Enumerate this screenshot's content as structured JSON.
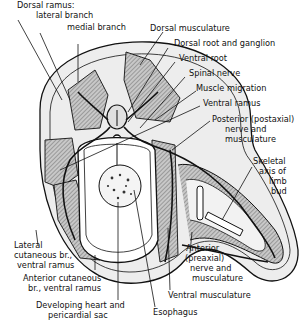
{
  "diagram": {
    "type": "anatomical cross-section",
    "labels": {
      "dorsal_ramus": "Dorsal ramus:",
      "lateral_branch": "lateral branch",
      "medial_branch": "medial branch",
      "dorsal_musculature": "Dorsal musculature",
      "dorsal_root_ganglion": "Dorsal root and ganglion",
      "ventral_root": "Ventral root",
      "spinal_nerve": "Spinal nerve",
      "muscle_migration": "Muscle migration",
      "ventral_ramus": "Ventral ramus",
      "posterior_1": "Posterior (postaxial)",
      "posterior_2": "nerve and",
      "posterior_3": "musculature",
      "skeletal_1": "Skeletal",
      "skeletal_2": "axis of",
      "skeletal_3": "limb",
      "skeletal_4": "bud",
      "lateral_cut_1": "Lateral",
      "lateral_cut_2": "cutaneous br.,",
      "lateral_cut_3": "ventral ramus",
      "anterior_cut_1": "Anterior cutaneous",
      "anterior_cut_2": "br., ventral ramus",
      "heart_1": "Developing heart and",
      "heart_2": "pericardial sac",
      "anterior_pre_1": "Anterior",
      "anterior_pre_2": "(preaxial)",
      "anterior_pre_3": "nerve and",
      "anterior_pre_4": "musculature",
      "ventral_musculature": "Ventral musculature",
      "esophagus": "Esophagus"
    }
  }
}
